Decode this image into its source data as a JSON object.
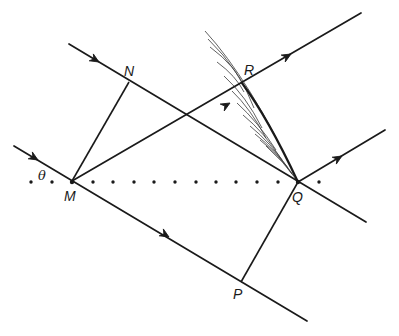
{
  "diagram": {
    "type": "huygens-wavefront-construction",
    "points": {
      "M": "M",
      "N": "N",
      "P": "P",
      "Q": "Q",
      "R": "R"
    },
    "angle_label": "θ",
    "rays": [
      {
        "name": "upper-incident-ray",
        "from": "N",
        "to": "Q",
        "direction": "incoming"
      },
      {
        "name": "lower-incident-ray",
        "from": "M",
        "to": "P",
        "direction": "incoming"
      },
      {
        "name": "scattered-ray-from-M",
        "from": "M",
        "to": "R",
        "direction": "outgoing"
      },
      {
        "name": "scattered-ray-from-Q",
        "from": "Q",
        "direction": "outgoing"
      }
    ],
    "wavefronts": [
      {
        "name": "incident-wavefront",
        "from": "M",
        "to": "N"
      },
      {
        "name": "wavefront-PQ",
        "from": "P",
        "to": "Q"
      },
      {
        "name": "envelope-RQ",
        "from": "R",
        "to": "Q"
      }
    ],
    "dotted_line": {
      "name": "row-of-scatterers",
      "count": 14
    }
  }
}
